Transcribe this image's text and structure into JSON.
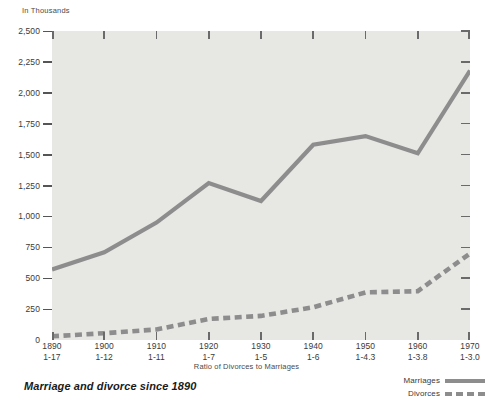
{
  "units_caption": "In Thousands",
  "figure_title": "Marriage and divorce since 1890",
  "x_axis_caption": "Ratio of Divorces to Marriages",
  "legend": {
    "marriages_label": "Marriages",
    "divorces_label": "Divorces"
  },
  "colors": {
    "line": "#8d8d8d",
    "plot_background": "#e7e7e4",
    "page_background": "#ffffff",
    "text": "#3a3a3a"
  },
  "y_ticks": [
    {
      "label": "2,500",
      "value": 2500
    },
    {
      "label": "2,250",
      "value": 2250
    },
    {
      "label": "2,000",
      "value": 2000
    },
    {
      "label": "1,750",
      "value": 1750
    },
    {
      "label": "1,500",
      "value": 1500
    },
    {
      "label": "1,250",
      "value": 1250
    },
    {
      "label": "1,000",
      "value": 1000
    },
    {
      "label": "750",
      "value": 750
    },
    {
      "label": "500",
      "value": 500
    },
    {
      "label": "250",
      "value": 250
    },
    {
      "label": "0",
      "value": 0
    }
  ],
  "x_ticks": [
    {
      "year": "1890",
      "ratio": "1-17"
    },
    {
      "year": "1900",
      "ratio": "1-12"
    },
    {
      "year": "1910",
      "ratio": "1-11"
    },
    {
      "year": "1920",
      "ratio": "1-7"
    },
    {
      "year": "1930",
      "ratio": "1-5"
    },
    {
      "year": "1940",
      "ratio": "1-6"
    },
    {
      "year": "1950",
      "ratio": "1-4.3"
    },
    {
      "year": "1960",
      "ratio": "1-3.8"
    },
    {
      "year": "1970",
      "ratio": "1-3.0"
    }
  ],
  "chart_data": {
    "type": "line",
    "title": "Marriage and divorce since 1890",
    "xlabel": "Ratio of Divorces to Marriages",
    "ylabel": "In Thousands",
    "categories": [
      "1890",
      "1900",
      "1910",
      "1920",
      "1930",
      "1940",
      "1950",
      "1960",
      "1970"
    ],
    "x": [
      1890,
      1900,
      1910,
      1920,
      1930,
      1940,
      1950,
      1960,
      1970
    ],
    "ylim": [
      0,
      2500
    ],
    "ytick_step": 250,
    "grid": false,
    "legend_position": "bottom-right",
    "series": [
      {
        "name": "Marriages",
        "style": "solid",
        "color": "#8d8d8d",
        "values": [
          570,
          710,
          950,
          1270,
          1125,
          1580,
          1650,
          1510,
          2180
        ]
      },
      {
        "name": "Divorces",
        "style": "dashed",
        "color": "#8d8d8d",
        "values": [
          30,
          55,
          85,
          170,
          195,
          265,
          385,
          395,
          700
        ]
      }
    ],
    "ratio_labels": [
      "1-17",
      "1-12",
      "1-11",
      "1-7",
      "1-5",
      "1-6",
      "1-4.3",
      "1-3.8",
      "1-3.0"
    ]
  }
}
